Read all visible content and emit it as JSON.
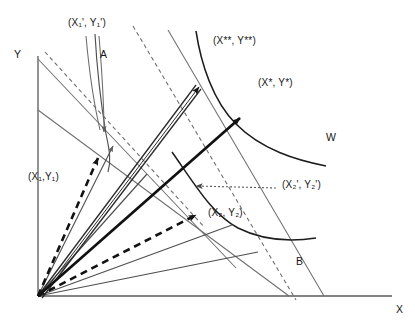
{
  "figure": {
    "type": "economics-indifference-curve-diagram",
    "background": "#ffffff",
    "ink": "#161616",
    "gray_ink": "#6e6e6e"
  },
  "axes": {
    "y_label": "Y",
    "x_label": "X",
    "origin": [
      38,
      296
    ],
    "y_top": [
      38,
      56
    ],
    "x_right": [
      392,
      296
    ]
  },
  "labels": {
    "x1p_y1p": "(X₁', Y₁')",
    "x1_y1": "(X₁,Y₁)",
    "x2p_y2p": "(X₂', Y₂')",
    "x2_y2": "(X₂, Y₂)",
    "xss_yss": "(X**, Y**)",
    "xs_ys": "(X*, Y*)",
    "curve_a": "A",
    "curve_b": "B",
    "curve_w": "W"
  },
  "curves": {
    "a": {
      "name": "A",
      "description": "steep narrow indifference curve upper-left"
    },
    "b": {
      "name": "B",
      "description": "convex indifference curve lower-right"
    },
    "w": {
      "name": "W",
      "description": "welfare / production frontier upper-right"
    }
  },
  "rays": [
    {
      "name": "ray-to-x1p-y1p",
      "style": "thin-solid"
    },
    {
      "name": "ray-to-x1-y1",
      "style": "thick-dashed"
    },
    {
      "name": "ray-to-x2-y2",
      "style": "thick-dashed"
    },
    {
      "name": "ray-to-xss-yss",
      "style": "double-line-arrow"
    },
    {
      "name": "ray-to-xs-ys",
      "style": "thick-solid-arrow"
    }
  ],
  "budget_lines": [
    {
      "name": "budget-dashed-1",
      "style": "dashed"
    },
    {
      "name": "budget-dashed-2",
      "style": "dashed"
    },
    {
      "name": "budget-solid-1",
      "style": "thin-solid"
    },
    {
      "name": "budget-solid-2",
      "style": "thin-solid"
    }
  ]
}
